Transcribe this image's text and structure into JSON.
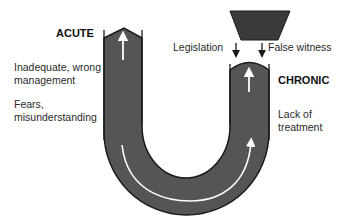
{
  "labels": {
    "acute": "ACUTE",
    "chronic": "CHRONIC",
    "inadequate_line1": "Inadequate, wrong",
    "inadequate_line2": "management",
    "fears_line1": "Fears,",
    "fears_line2": "misunderstanding",
    "legislation": "Legislation",
    "false_witness": "False witness",
    "lack_line1": "Lack of",
    "lack_line2": "treatment"
  },
  "colors": {
    "tube_fill": "#555555",
    "tube_edge": "#1a1a1a",
    "arrow": "#ffffff",
    "block": "#3a3a3a",
    "down_arrow": "#1a1a1a"
  }
}
